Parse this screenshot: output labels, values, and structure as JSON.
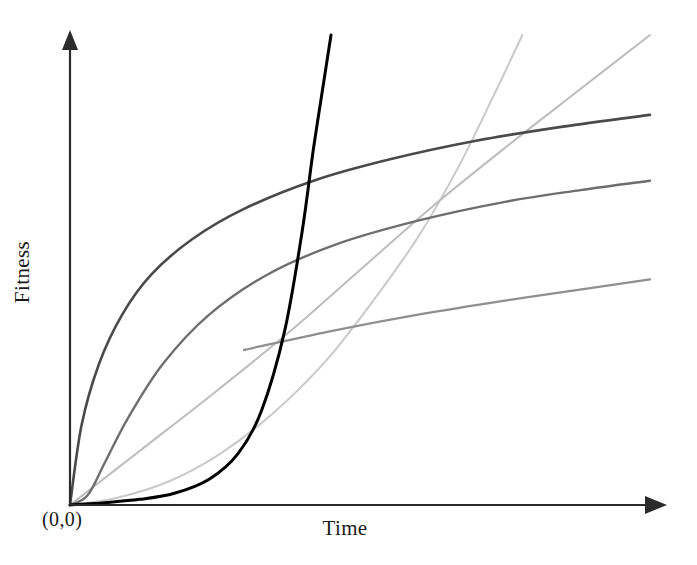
{
  "chart_data": {
    "type": "line",
    "title": "",
    "xlabel": "Time",
    "ylabel": "Fitness",
    "origin_label": "(0,0)",
    "grid": false,
    "legend": "none",
    "axes": {
      "x_arrow": true,
      "y_arrow": true,
      "xlim": [
        0,
        1
      ],
      "ylim": [
        0,
        1
      ],
      "tick_labels": [],
      "axis_color": "#2b2b2b"
    },
    "series": [
      {
        "name": "exponential",
        "color": "#000000",
        "width": 3.0,
        "description": "flat then explosive exponential growth, exits top of plot",
        "x": [
          0.0,
          0.06,
          0.12,
          0.18,
          0.24,
          0.29,
          0.33,
          0.37,
          0.4,
          0.42,
          0.44,
          0.45
        ],
        "y": [
          0.0,
          0.005,
          0.012,
          0.025,
          0.055,
          0.11,
          0.2,
          0.37,
          0.58,
          0.76,
          0.92,
          1.0
        ]
      },
      {
        "name": "fast-saturating-logarithmic",
        "color": "#4a4a4a",
        "width": 2.6,
        "description": "steep early rise, saturates to a gentle slope, ends at right edge upper area",
        "x": [
          0.0,
          0.02,
          0.05,
          0.09,
          0.14,
          0.21,
          0.3,
          0.42,
          0.55,
          0.7,
          0.85,
          1.0
        ],
        "y": [
          0.0,
          0.17,
          0.3,
          0.405,
          0.49,
          0.565,
          0.63,
          0.69,
          0.735,
          0.775,
          0.805,
          0.83
        ]
      },
      {
        "name": "slow-saturating-logarithmic",
        "color": "#6e6e6e",
        "width": 2.4,
        "description": "delayed steep rise then saturating, crosses the first curve mid-plot",
        "x": [
          0.0,
          0.03,
          0.06,
          0.1,
          0.16,
          0.24,
          0.34,
          0.46,
          0.6,
          0.75,
          0.88,
          1.0
        ],
        "y": [
          0.0,
          0.02,
          0.09,
          0.185,
          0.3,
          0.405,
          0.49,
          0.555,
          0.605,
          0.645,
          0.67,
          0.69
        ]
      },
      {
        "name": "near-linear",
        "color": "#bdbdbd",
        "width": 2.0,
        "description": "faint nearly straight line from origin rising to the top right",
        "x": [
          0.0,
          0.12,
          0.25,
          0.38,
          0.5,
          0.62,
          0.75,
          0.88,
          1.0
        ],
        "y": [
          0.0,
          0.115,
          0.24,
          0.37,
          0.5,
          0.63,
          0.76,
          0.885,
          1.0
        ]
      },
      {
        "name": "quadratic",
        "color": "#c9c9c9",
        "width": 2.0,
        "description": "faint slow-start power curve accelerating upward, exits top of plot",
        "x": [
          0.0,
          0.08,
          0.17,
          0.26,
          0.35,
          0.44,
          0.52,
          0.6,
          0.67,
          0.73,
          0.78
        ],
        "y": [
          0.0,
          0.015,
          0.05,
          0.11,
          0.195,
          0.305,
          0.43,
          0.57,
          0.72,
          0.87,
          1.0
        ]
      },
      {
        "name": "mid-gray-linear-right",
        "color": "#8f8f8f",
        "width": 2.2,
        "description": "faint shallow line rising to the right edge below the saturating curves",
        "x": [
          0.3,
          0.45,
          0.6,
          0.75,
          0.9,
          1.0
        ],
        "y": [
          0.33,
          0.37,
          0.405,
          0.435,
          0.462,
          0.48
        ]
      }
    ]
  },
  "figure": {
    "background": "#ffffff"
  }
}
